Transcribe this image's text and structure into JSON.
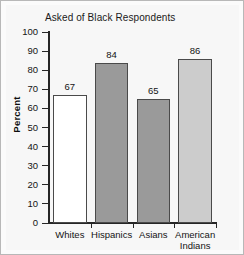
{
  "chart_data": {
    "type": "bar",
    "title": "Asked of Black Respondents",
    "xlabel": "",
    "ylabel": "Percent",
    "categories": [
      "Whites",
      "Hispanics",
      "Asians",
      "American Indians"
    ],
    "category_lines": [
      [
        "Whites"
      ],
      [
        "Hispanics"
      ],
      [
        "Asians"
      ],
      [
        "American",
        "Indians"
      ]
    ],
    "values": [
      67,
      84,
      65,
      86
    ],
    "value_labels": [
      "67",
      "84",
      "65",
      "86"
    ],
    "bar_colors": [
      "#ffffff",
      "#9a9a9a",
      "#9a9a9a",
      "#cccccc"
    ],
    "bar_border_color": "#4a4a4a",
    "ylim": [
      0,
      100
    ],
    "ytick_step": 10,
    "ytick_labels": [
      "100",
      "90",
      "80",
      "70",
      "60",
      "50",
      "40",
      "30",
      "20",
      "10",
      "0"
    ],
    "ytick_values": [
      100,
      90,
      80,
      70,
      60,
      50,
      40,
      30,
      20,
      10,
      0
    ],
    "grid": false,
    "legend": false
  },
  "figure": {
    "background": "#f7f7f7",
    "border_color": "#b8b8b8",
    "axis_color": "#262626",
    "text_color": "#141414"
  }
}
